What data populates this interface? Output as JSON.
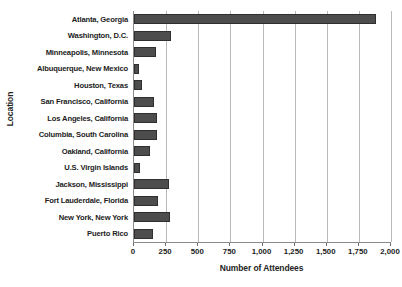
{
  "chart_data": {
    "type": "bar",
    "orientation": "horizontal",
    "title": "",
    "xlabel": "Number of Attendees",
    "ylabel": "Location",
    "xlim": [
      0,
      2000
    ],
    "xticks": [
      0,
      250,
      500,
      750,
      1000,
      1250,
      1500,
      1750,
      2000
    ],
    "xtick_labels": [
      "0",
      "250",
      "500",
      "750",
      "1,000",
      "1,250",
      "1,500",
      "1,750",
      "2,000"
    ],
    "grid": true,
    "grid_axis": "x",
    "legend": false,
    "bar_color": "#4d4d4d",
    "bar_edge_color": "#2f2f2f",
    "categories": [
      "Atlanta, Georgia",
      "Washington, D.C.",
      "Minneapolis, Minnesota",
      "Albuquerque, New Mexico",
      "Houston, Texas",
      "San Francisco, California",
      "Los Angeles, California",
      "Columbia, South Carolina",
      "Oakland, California",
      "U.S. Virgin Islands",
      "Jackson, Mississippi",
      "Fort Lauderdale, Florida",
      "New York, New York",
      "Puerto Rico"
    ],
    "values": [
      1880,
      290,
      170,
      40,
      65,
      155,
      180,
      180,
      125,
      50,
      270,
      190,
      280,
      145
    ]
  }
}
